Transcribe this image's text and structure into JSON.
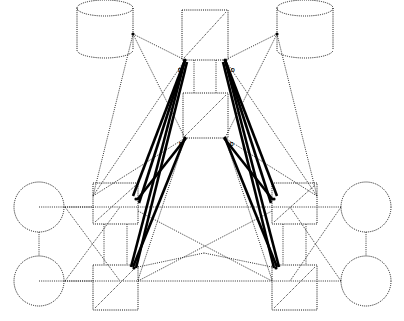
{
  "diagram": {
    "background_color": "#ffffff",
    "stroke_color": "#111111",
    "thick_edge_color": "#000000",
    "node_style": "dotted-outline",
    "nodes": [
      {
        "id": "db-left",
        "name": "database-cylinder-left",
        "shape": "cylinder",
        "label": "",
        "cx": 105,
        "cy": 29,
        "rx": 28,
        "ry": 8,
        "height": 42
      },
      {
        "id": "db-right",
        "name": "database-cylinder-right",
        "shape": "cylinder",
        "label": "",
        "cx": 305,
        "cy": 29,
        "rx": 28,
        "ry": 8,
        "height": 42
      },
      {
        "id": "box-center-top",
        "name": "center-node-top",
        "shape": "rect-diagonal",
        "label": "",
        "x": 182,
        "y": 10,
        "w": 46,
        "h": 50
      },
      {
        "id": "box-center-bot",
        "name": "center-node-bottom",
        "shape": "rect-diagonal",
        "label": "",
        "x": 183,
        "y": 93,
        "w": 45,
        "h": 45
      },
      {
        "id": "circle-lt",
        "name": "endpoint-circle-left-top",
        "shape": "circle",
        "label": "",
        "cx": 39,
        "cy": 207,
        "r": 25
      },
      {
        "id": "circle-lb",
        "name": "endpoint-circle-left-bottom",
        "shape": "circle",
        "label": "",
        "cx": 39,
        "cy": 281,
        "r": 25
      },
      {
        "id": "circle-rt",
        "name": "endpoint-circle-right-top",
        "shape": "circle",
        "label": "",
        "cx": 366,
        "cy": 207,
        "r": 25
      },
      {
        "id": "circle-rb",
        "name": "endpoint-circle-right-bottom",
        "shape": "circle",
        "label": "",
        "cx": 366,
        "cy": 281,
        "r": 25
      },
      {
        "id": "box-lt",
        "name": "switch-node-left-top",
        "shape": "rect-diagonal",
        "label": "",
        "x": 93,
        "y": 183,
        "w": 45,
        "h": 41
      },
      {
        "id": "box-lb",
        "name": "switch-node-left-bottom",
        "shape": "rect-diagonal",
        "label": "",
        "x": 93,
        "y": 265,
        "w": 45,
        "h": 45
      },
      {
        "id": "box-rt",
        "name": "switch-node-right-top",
        "shape": "rect-diagonal",
        "label": "",
        "x": 272,
        "y": 183,
        "w": 45,
        "h": 41
      },
      {
        "id": "box-rb",
        "name": "switch-node-right-bottom",
        "shape": "rect-diagonal",
        "label": "",
        "x": 272,
        "y": 265,
        "w": 45,
        "h": 45
      }
    ],
    "edge_labels": [
      {
        "name": "edge-label-top-left",
        "text": "D",
        "x": 178,
        "y": 72
      },
      {
        "name": "edge-label-top-right",
        "text": "D",
        "x": 231,
        "y": 72
      },
      {
        "name": "edge-label-bottom-left",
        "text": "D",
        "x": 179,
        "y": 146
      },
      {
        "name": "edge-label-bottom-right",
        "text": "D",
        "x": 230,
        "y": 146
      }
    ],
    "thick_edges": [
      {
        "name": "trunk-edge-1",
        "x1": 185,
        "y1": 60,
        "x2": 133,
        "y2": 196
      },
      {
        "name": "trunk-edge-2",
        "x1": 185,
        "y1": 60,
        "x2": 139,
        "y2": 203
      },
      {
        "name": "trunk-edge-3",
        "x1": 185,
        "y1": 60,
        "x2": 131,
        "y2": 267
      },
      {
        "name": "trunk-edge-4",
        "x1": 187,
        "y1": 62,
        "x2": 136,
        "y2": 268
      },
      {
        "name": "trunk-edge-5",
        "x1": 225,
        "y1": 60,
        "x2": 277,
        "y2": 196
      },
      {
        "name": "trunk-edge-6",
        "x1": 225,
        "y1": 60,
        "x2": 271,
        "y2": 203
      },
      {
        "name": "trunk-edge-7",
        "x1": 225,
        "y1": 60,
        "x2": 279,
        "y2": 267
      },
      {
        "name": "trunk-edge-8",
        "x1": 223,
        "y1": 62,
        "x2": 274,
        "y2": 268
      },
      {
        "name": "trunk-edge-9",
        "x1": 185,
        "y1": 138,
        "x2": 133,
        "y2": 267
      },
      {
        "name": "trunk-edge-10",
        "x1": 225,
        "y1": 138,
        "x2": 277,
        "y2": 267
      },
      {
        "name": "trunk-edge-11",
        "x1": 186,
        "y1": 138,
        "x2": 137,
        "y2": 200
      },
      {
        "name": "trunk-edge-12",
        "x1": 224,
        "y1": 138,
        "x2": 273,
        "y2": 200
      }
    ],
    "thin_edges": [
      {
        "name": "edge-db-left-to-center-top",
        "x1": 133,
        "y1": 34,
        "x2": 185,
        "y2": 60
      },
      {
        "name": "edge-db-right-to-center-top",
        "x1": 277,
        "y1": 34,
        "x2": 225,
        "y2": 60
      },
      {
        "name": "edge-db-left-to-boxlt",
        "x1": 133,
        "y1": 34,
        "x2": 93,
        "y2": 196
      },
      {
        "name": "edge-db-right-to-boxrt",
        "x1": 277,
        "y1": 34,
        "x2": 317,
        "y2": 196
      },
      {
        "name": "edge-db-left-cross",
        "x1": 133,
        "y1": 34,
        "x2": 185,
        "y2": 138
      },
      {
        "name": "edge-db-right-cross",
        "x1": 277,
        "y1": 34,
        "x2": 225,
        "y2": 138
      },
      {
        "name": "edge-centertop-to-lt",
        "x1": 185,
        "y1": 60,
        "x2": 93,
        "y2": 196
      },
      {
        "name": "edge-centertop-to-rt",
        "x1": 225,
        "y1": 60,
        "x2": 317,
        "y2": 196
      },
      {
        "name": "edge-centerbot-to-lt",
        "x1": 185,
        "y1": 138,
        "x2": 93,
        "y2": 196
      },
      {
        "name": "edge-centerbot-to-rt",
        "x1": 225,
        "y1": 138,
        "x2": 317,
        "y2": 196
      },
      {
        "name": "edge-centerbot-to-lb",
        "x1": 185,
        "y1": 138,
        "x2": 138,
        "y2": 280
      },
      {
        "name": "edge-centerbot-to-rb",
        "x1": 225,
        "y1": 138,
        "x2": 272,
        "y2": 280
      },
      {
        "name": "edge-lt-bus",
        "x1": 65,
        "y1": 207,
        "x2": 317,
        "y2": 207
      },
      {
        "name": "edge-lb-bus",
        "x1": 65,
        "y1": 281,
        "x2": 317,
        "y2": 281
      },
      {
        "name": "edge-circle-l-link",
        "x1": 39,
        "y1": 232,
        "x2": 39,
        "y2": 256
      },
      {
        "name": "edge-circle-r-link",
        "x1": 366,
        "y1": 232,
        "x2": 366,
        "y2": 256
      },
      {
        "name": "edge-left-cross-a",
        "x1": 65,
        "y1": 207,
        "x2": 120,
        "y2": 281
      },
      {
        "name": "edge-left-cross-b",
        "x1": 65,
        "y1": 281,
        "x2": 120,
        "y2": 207
      },
      {
        "name": "edge-right-cross-a",
        "x1": 341,
        "y1": 207,
        "x2": 290,
        "y2": 281
      },
      {
        "name": "edge-right-cross-b",
        "x1": 341,
        "y1": 281,
        "x2": 290,
        "y2": 207
      },
      {
        "name": "edge-mid-cross-a",
        "x1": 138,
        "y1": 211,
        "x2": 272,
        "y2": 281
      },
      {
        "name": "edge-mid-cross-b",
        "x1": 138,
        "y1": 281,
        "x2": 272,
        "y2": 211
      },
      {
        "name": "edge-lb-to-center",
        "x1": 138,
        "y1": 267,
        "x2": 204,
        "y2": 253
      },
      {
        "name": "edge-rb-to-center",
        "x1": 272,
        "y1": 267,
        "x2": 204,
        "y2": 253
      },
      {
        "name": "edge-boxlt-vert",
        "x1": 104,
        "y1": 224,
        "x2": 104,
        "y2": 265
      },
      {
        "name": "edge-boxlt-vert2",
        "x1": 127,
        "y1": 224,
        "x2": 127,
        "y2": 265
      },
      {
        "name": "edge-boxrt-vert",
        "x1": 283,
        "y1": 224,
        "x2": 283,
        "y2": 265
      },
      {
        "name": "edge-boxrt-vert2",
        "x1": 306,
        "y1": 224,
        "x2": 306,
        "y2": 265
      },
      {
        "name": "edge-center-vert",
        "x1": 194,
        "y1": 60,
        "x2": 194,
        "y2": 93
      },
      {
        "name": "edge-center-vert2",
        "x1": 216,
        "y1": 60,
        "x2": 216,
        "y2": 93
      },
      {
        "name": "edge-boxlt-to-circle-lt",
        "x1": 39,
        "y1": 207,
        "x2": 93,
        "y2": 207
      },
      {
        "name": "edge-boxlb-to-circle-lb",
        "x1": 39,
        "y1": 281,
        "x2": 93,
        "y2": 281
      },
      {
        "name": "edge-boxrt-to-circle-rt",
        "x1": 341,
        "y1": 207,
        "x2": 317,
        "y2": 207
      },
      {
        "name": "edge-boxrb-to-circle-rb",
        "x1": 341,
        "y1": 281,
        "x2": 317,
        "y2": 281
      }
    ],
    "ports": [
      {
        "name": "port-center-top-left",
        "cx": 185,
        "cy": 60
      },
      {
        "name": "port-center-top-right",
        "cx": 225,
        "cy": 60
      },
      {
        "name": "port-center-bot-left",
        "cx": 185,
        "cy": 138
      },
      {
        "name": "port-center-bot-right",
        "cx": 225,
        "cy": 138
      },
      {
        "name": "port-box-lt",
        "cx": 136,
        "cy": 199
      },
      {
        "name": "port-box-rt",
        "cx": 274,
        "cy": 199
      },
      {
        "name": "port-box-lb",
        "cx": 134,
        "cy": 268
      },
      {
        "name": "port-box-rb",
        "cx": 276,
        "cy": 268
      },
      {
        "name": "port-db-left",
        "cx": 133,
        "cy": 34
      },
      {
        "name": "port-db-right",
        "cx": 277,
        "cy": 34
      }
    ]
  }
}
